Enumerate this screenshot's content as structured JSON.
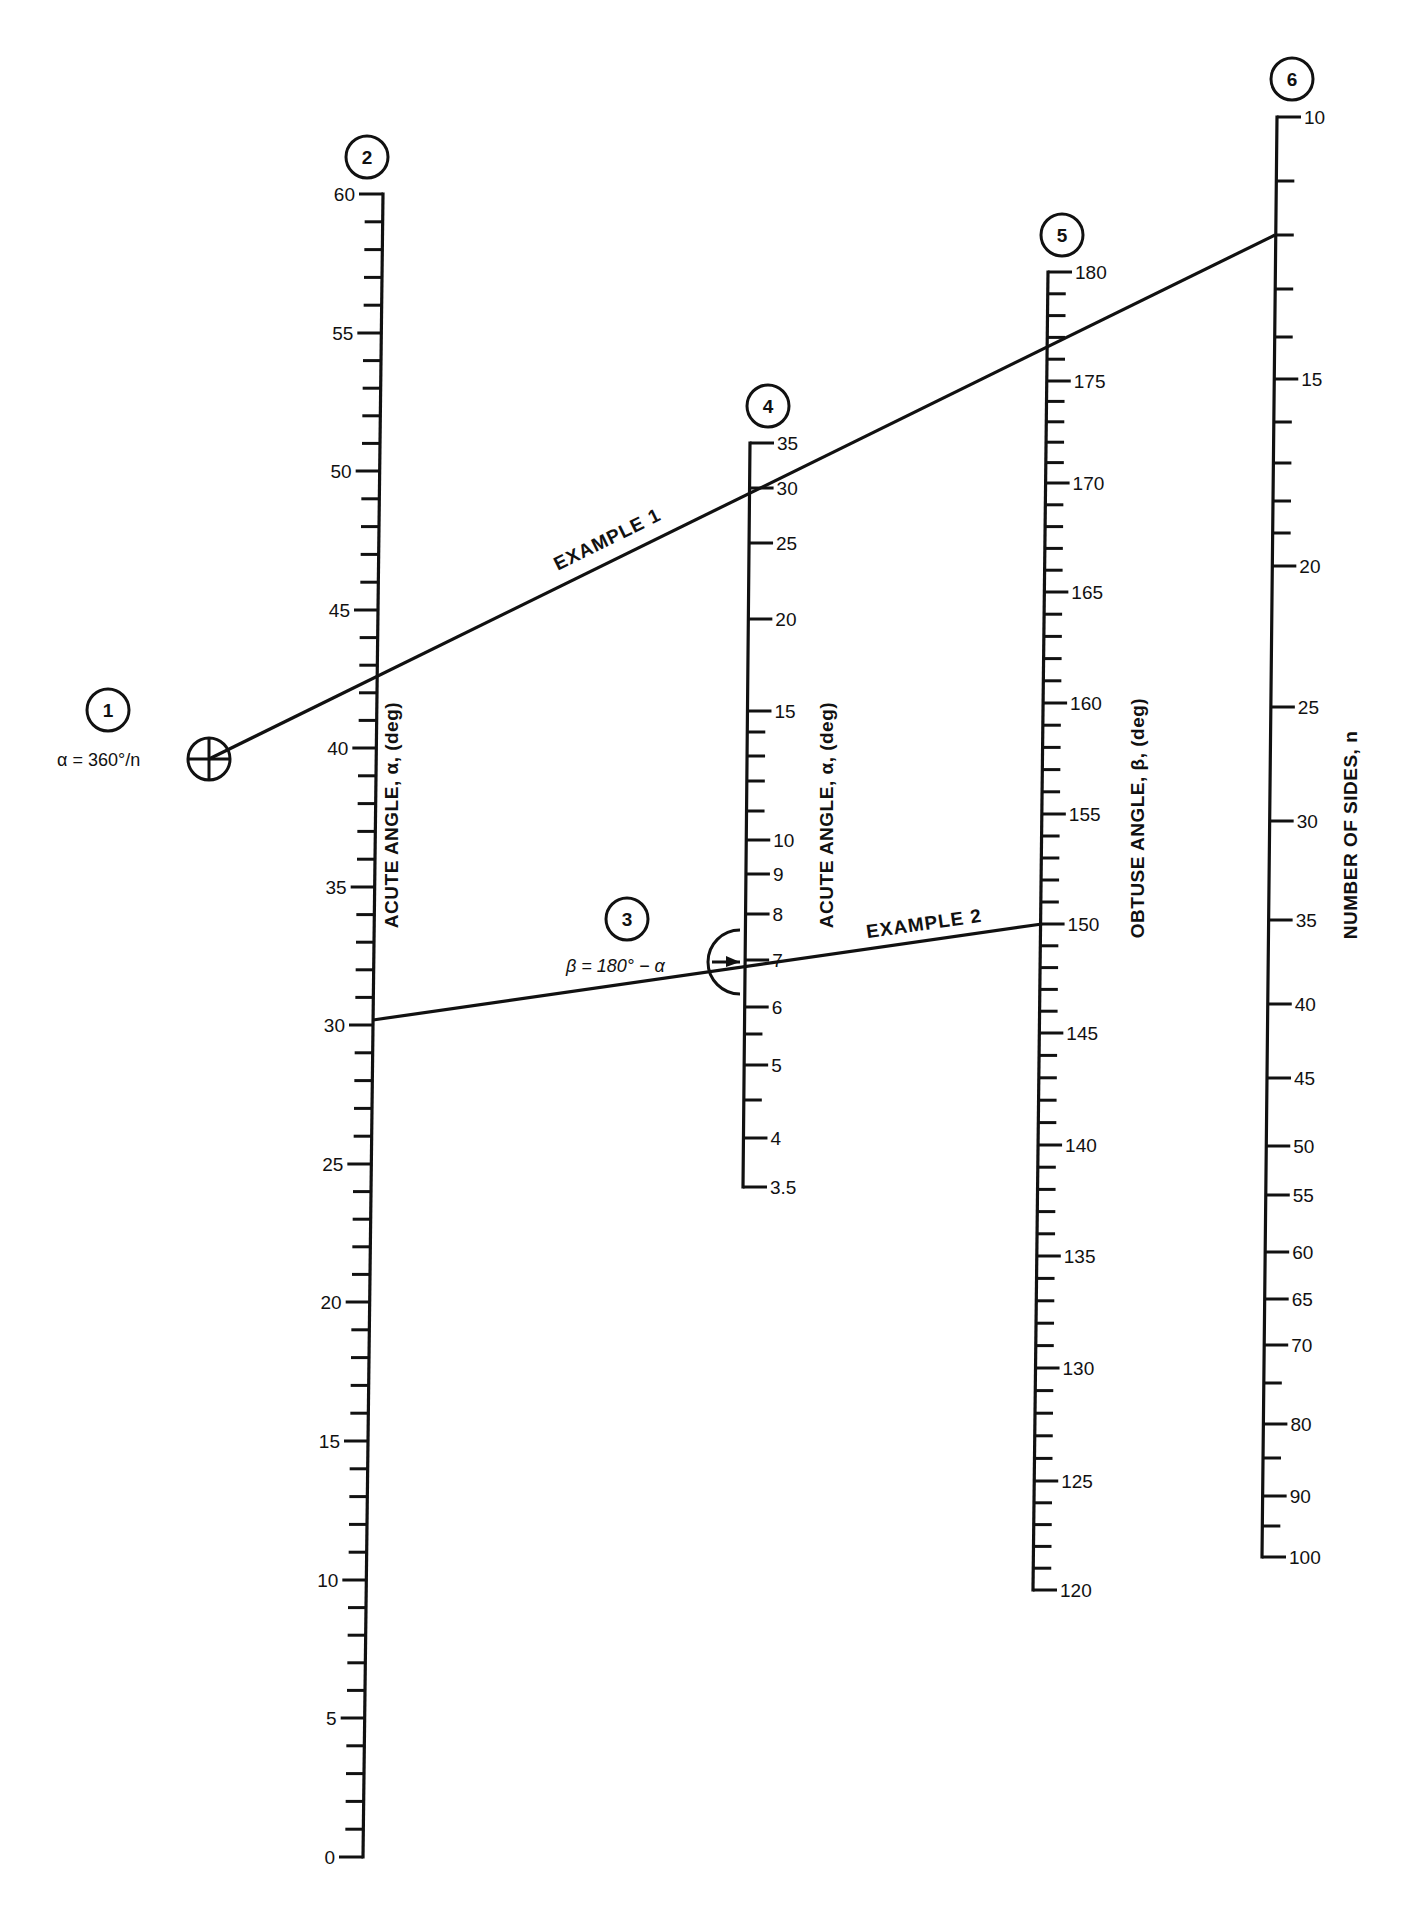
{
  "figure": {
    "background": "#ffffff",
    "ink": "#111111",
    "type": "nomogram"
  },
  "steps": [
    {
      "num": "1",
      "cx": 108,
      "cy": 710
    },
    {
      "num": "2",
      "cx": 367,
      "cy": 157
    },
    {
      "num": "3",
      "cx": 627,
      "cy": 919
    },
    {
      "num": "4",
      "cx": 768,
      "cy": 406
    },
    {
      "num": "5",
      "cx": 1062,
      "cy": 235
    },
    {
      "num": "6",
      "cx": 1292,
      "cy": 79
    }
  ],
  "formulas": {
    "alpha": {
      "text": "α = 360°/n",
      "x": 57,
      "y": 766
    },
    "beta": {
      "text": "β = 180° − α",
      "x": 566,
      "y": 972
    }
  },
  "axes": [
    {
      "id": "axis-2",
      "title": "ACUTE ANGLE, α, (deg)",
      "title_pos": {
        "x": 398,
        "y": 815
      },
      "x_top": 383,
      "x_bottom": 363,
      "y_top": 194,
      "y_bottom": 1857,
      "tick_side": "left",
      "major": [
        {
          "v": "60",
          "y": 194
        },
        {
          "v": "55",
          "y": 333
        },
        {
          "v": "50",
          "y": 471
        },
        {
          "v": "45",
          "y": 610
        },
        {
          "v": "40",
          "y": 748
        },
        {
          "v": "35",
          "y": 887
        },
        {
          "v": "30",
          "y": 1025
        },
        {
          "v": "25",
          "y": 1164
        },
        {
          "v": "20",
          "y": 1302
        },
        {
          "v": "15",
          "y": 1441
        },
        {
          "v": "10",
          "y": 1580
        },
        {
          "v": "5",
          "y": 1718
        },
        {
          "v": "0",
          "y": 1857
        }
      ],
      "minor_per_major": 4
    },
    {
      "id": "axis-4",
      "title": "ACUTE    ANGLE, α, (deg)",
      "title_pos": {
        "x": 833,
        "y": 815
      },
      "x_top": 750,
      "x_bottom": 743,
      "y_top": 443,
      "y_bottom": 1187,
      "tick_side": "right",
      "major": [
        {
          "v": "35",
          "y": 443
        },
        {
          "v": "30",
          "y": 488
        },
        {
          "v": "25",
          "y": 543
        },
        {
          "v": "20",
          "y": 619
        },
        {
          "v": "15",
          "y": 711
        },
        {
          "v": "10",
          "y": 840
        },
        {
          "v": "9",
          "y": 874
        },
        {
          "v": "8",
          "y": 914
        },
        {
          "v": "7",
          "y": 960
        },
        {
          "v": "6",
          "y": 1007
        },
        {
          "v": "5",
          "y": 1065
        },
        {
          "v": "4",
          "y": 1138
        },
        {
          "v": "3.5",
          "y": 1187
        }
      ],
      "minor": [
        732,
        756,
        781,
        811,
        1034,
        1100
      ]
    },
    {
      "id": "axis-5",
      "title": "OBTUSE ANGLE, β, (deg)",
      "title_pos": {
        "x": 1144,
        "y": 818
      },
      "x_top": 1048,
      "x_bottom": 1033,
      "y_top": 272,
      "y_bottom": 1590,
      "tick_side": "right",
      "major": [
        {
          "v": "180",
          "y": 272
        },
        {
          "v": "175",
          "y": 381
        },
        {
          "v": "170",
          "y": 483
        },
        {
          "v": "165",
          "y": 592
        },
        {
          "v": "160",
          "y": 703
        },
        {
          "v": "155",
          "y": 814
        },
        {
          "v": "150",
          "y": 924
        },
        {
          "v": "145",
          "y": 1033
        },
        {
          "v": "140",
          "y": 1145
        },
        {
          "v": "135",
          "y": 1256
        },
        {
          "v": "130",
          "y": 1368
        },
        {
          "v": "125",
          "y": 1481
        },
        {
          "v": "120",
          "y": 1590
        }
      ],
      "minor_per_major": 4
    },
    {
      "id": "axis-6",
      "title": "NUMBER OF SIDES, n",
      "title_pos": {
        "x": 1357,
        "y": 835
      },
      "x_top": 1277,
      "x_bottom": 1262,
      "y_top": 117,
      "y_bottom": 1557,
      "tick_side": "right",
      "major": [
        {
          "v": "10",
          "y": 117
        },
        {
          "v": "15",
          "y": 379
        },
        {
          "v": "20",
          "y": 566
        },
        {
          "v": "25",
          "y": 707
        },
        {
          "v": "30",
          "y": 821
        },
        {
          "v": "35",
          "y": 920
        },
        {
          "v": "40",
          "y": 1004
        },
        {
          "v": "45",
          "y": 1078
        },
        {
          "v": "50",
          "y": 1146
        },
        {
          "v": "55",
          "y": 1195
        },
        {
          "v": "60",
          "y": 1252
        },
        {
          "v": "65",
          "y": 1299
        },
        {
          "v": "70",
          "y": 1345
        },
        {
          "v": "80",
          "y": 1424
        },
        {
          "v": "90",
          "y": 1496
        },
        {
          "v": "100",
          "y": 1557
        }
      ],
      "minor": [
        181,
        235,
        289,
        337,
        422,
        463,
        501,
        533,
        1383,
        1458,
        1526
      ]
    }
  ],
  "examples": [
    {
      "label": "EXAMPLE 1",
      "from": {
        "x": 209,
        "y": 759
      },
      "to": {
        "x": 1275,
        "y": 235
      },
      "label_pos": {
        "x": 610,
        "y": 545
      },
      "label_angle": -26.2,
      "description": "n = 12 gives α = 30 and passes through reference point 1"
    },
    {
      "label": "EXAMPLE 2",
      "from": {
        "x": 373,
        "y": 1020
      },
      "to": {
        "x": 1042,
        "y": 924
      },
      "label_pos": {
        "x": 925,
        "y": 930
      },
      "label_angle": -8.2,
      "description": "α = 30 on axis 2, through pivot at 7 on axis 4, to β = 150"
    }
  ],
  "markers": {
    "crosshair": {
      "cx": 209,
      "cy": 759,
      "r": 21
    },
    "pivot_half_circle": {
      "cx": 740,
      "cy": 962,
      "r": 32
    }
  }
}
